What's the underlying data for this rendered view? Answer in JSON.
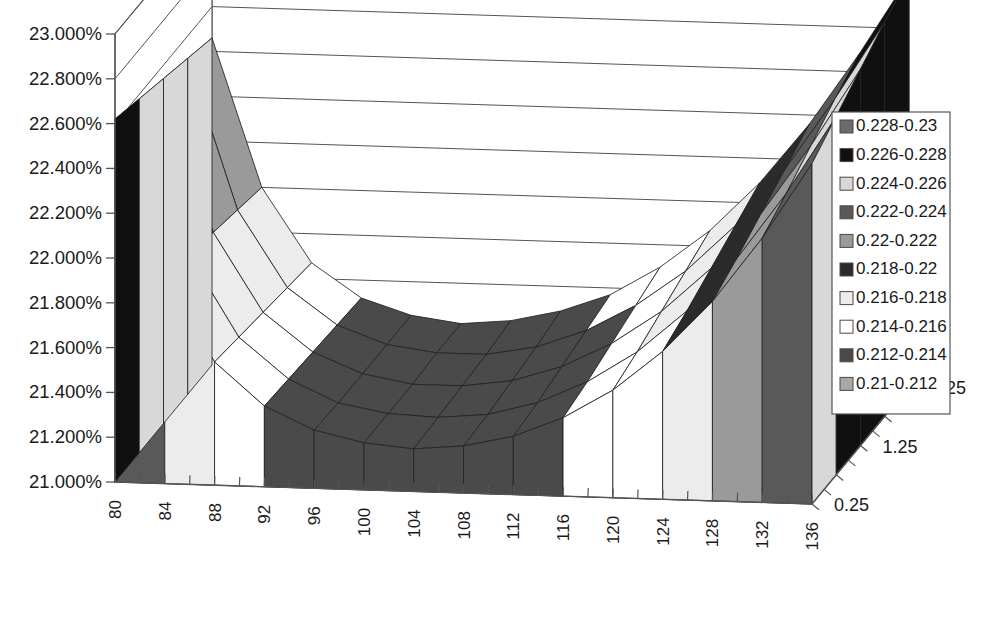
{
  "chart_data": {
    "type": "surface3d",
    "title": "",
    "xlabel": "",
    "ylabel": "",
    "zlabel": "",
    "value_axis": {
      "ticks": [
        "21.000%",
        "21.200%",
        "21.400%",
        "21.600%",
        "21.800%",
        "22.000%",
        "22.200%",
        "22.400%",
        "22.600%",
        "22.800%",
        "23.000%"
      ],
      "min": 0.21,
      "max": 0.23,
      "step": 0.002
    },
    "x_axis": {
      "ticks": [
        80,
        82,
        84,
        86,
        88,
        90,
        92,
        94,
        96,
        98,
        100,
        102,
        104,
        106,
        108,
        110,
        112,
        114,
        116,
        118,
        120,
        122,
        124,
        126,
        128,
        130,
        132,
        134,
        136
      ],
      "labeled_ticks": [
        "80",
        "84",
        "88",
        "92",
        "96",
        "100",
        "104",
        "108",
        "112",
        "116",
        "120",
        "124",
        "128",
        "132",
        "136"
      ],
      "min": 80,
      "max": 136,
      "step": 2
    },
    "z_axis": {
      "labeled_ticks": [
        "0.25",
        "1.25",
        "2.25"
      ],
      "min": 0.25,
      "max": 2.25
    },
    "categories": [
      80,
      84,
      88,
      92,
      96,
      100,
      104,
      108,
      112,
      116,
      120,
      124,
      128,
      132,
      136
    ],
    "series": [
      {
        "name": "0.25",
        "values": [
          0.2262,
          0.2192,
          0.2155,
          0.2136,
          0.2126,
          0.2121,
          0.2119,
          0.2121,
          0.2126,
          0.2135,
          0.2148,
          0.2166,
          0.2189,
          0.2218,
          0.2252
        ]
      },
      {
        "name": "0.75",
        "values": [
          0.2258,
          0.2189,
          0.2153,
          0.2135,
          0.2125,
          0.2121,
          0.212,
          0.2122,
          0.2128,
          0.2138,
          0.2152,
          0.2171,
          0.2195,
          0.2225,
          0.226
        ]
      },
      {
        "name": "1.25",
        "values": [
          0.2254,
          0.2186,
          0.2151,
          0.2134,
          0.2125,
          0.2121,
          0.2121,
          0.2124,
          0.2131,
          0.2142,
          0.2157,
          0.2177,
          0.2202,
          0.2233,
          0.2268
        ]
      },
      {
        "name": "1.75",
        "values": [
          0.225,
          0.2183,
          0.2149,
          0.2133,
          0.2125,
          0.2122,
          0.2122,
          0.2126,
          0.2134,
          0.2146,
          0.2162,
          0.2183,
          0.2209,
          0.2241,
          0.2276
        ]
      },
      {
        "name": "2.25",
        "values": [
          0.2246,
          0.218,
          0.2147,
          0.2132,
          0.2125,
          0.2122,
          0.2124,
          0.2129,
          0.2137,
          0.215,
          0.2167,
          0.2189,
          0.2216,
          0.2248,
          0.2283
        ]
      }
    ],
    "bands": [
      {
        "label": "0.228-0.23",
        "min": 0.228,
        "max": 0.23,
        "color": "#6b6b6b"
      },
      {
        "label": "0.226-0.228",
        "min": 0.226,
        "max": 0.228,
        "color": "#101010"
      },
      {
        "label": "0.224-0.226",
        "min": 0.224,
        "max": 0.226,
        "color": "#d8d8d8"
      },
      {
        "label": "0.222-0.224",
        "min": 0.222,
        "max": 0.224,
        "color": "#595959"
      },
      {
        "label": "0.22-0.222",
        "min": 0.22,
        "max": 0.222,
        "color": "#9a9a9a"
      },
      {
        "label": "0.218-0.22",
        "min": 0.218,
        "max": 0.22,
        "color": "#2b2b2b"
      },
      {
        "label": "0.216-0.218",
        "min": 0.216,
        "max": 0.218,
        "color": "#ececec"
      },
      {
        "label": "0.214-0.216",
        "min": 0.214,
        "max": 0.216,
        "color": "#ffffff"
      },
      {
        "label": "0.212-0.214",
        "min": 0.212,
        "max": 0.214,
        "color": "#4a4a4a"
      },
      {
        "label": "0.21-0.212",
        "min": 0.21,
        "max": 0.212,
        "color": "#a8a8a8"
      }
    ],
    "legend": {
      "position": "right",
      "items": [
        {
          "label": "0.228-0.23",
          "color": "#6b6b6b"
        },
        {
          "label": "0.226-0.228",
          "color": "#101010"
        },
        {
          "label": "0.224-0.226",
          "color": "#d8d8d8"
        },
        {
          "label": "0.222-0.224",
          "color": "#595959"
        },
        {
          "label": "0.22-0.222",
          "color": "#9a9a9a"
        },
        {
          "label": "0.218-0.22",
          "color": "#2b2b2b"
        },
        {
          "label": "0.216-0.218",
          "color": "#ececec"
        },
        {
          "label": "0.214-0.216",
          "color": "#ffffff"
        },
        {
          "label": "0.212-0.214",
          "color": "#4a4a4a"
        },
        {
          "label": "0.21-0.212",
          "color": "#a8a8a8"
        }
      ]
    },
    "grid": true,
    "axis_color": "#555555",
    "mesh_color": "#222222"
  }
}
